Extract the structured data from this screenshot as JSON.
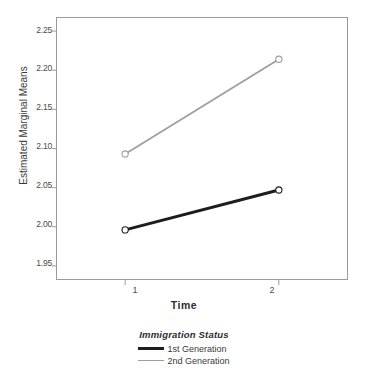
{
  "chart_data": {
    "type": "line",
    "title": "",
    "subtitle": "",
    "xlabel": "Time",
    "ylabel": "Estimated Marginal Means",
    "categories": [
      "1",
      "2"
    ],
    "x": [
      1,
      2
    ],
    "xlim": [
      0.55,
      2.45
    ],
    "ylim": [
      1.932,
      2.268
    ],
    "yticks": [
      "1.95",
      "2.00",
      "2.05",
      "2.10",
      "2.15",
      "2.20",
      "2.25"
    ],
    "ytick_values": [
      1.95,
      2.0,
      2.05,
      2.1,
      2.15,
      2.2,
      2.25
    ],
    "xticks": [
      "1",
      "2"
    ],
    "grid": false,
    "legend_position": "bottom",
    "legend_title": "Immigration Status",
    "markers": "open-circle",
    "series": [
      {
        "name": "1st Generation",
        "values": [
          1.996,
          2.047
        ],
        "color": "#1d1d1d",
        "linewidth": 3
      },
      {
        "name": "2nd Generation",
        "values": [
          2.093,
          2.214
        ],
        "color": "#9e9e9e",
        "linewidth": 1.7
      }
    ]
  },
  "axes": {
    "y_title": "Estimated Marginal Means",
    "x_title": "Time"
  },
  "legend": {
    "title": "Immigration Status",
    "entries": [
      {
        "label": "1st Generation"
      },
      {
        "label": "2nd Generation"
      }
    ]
  },
  "colors": {
    "series_1st_generation": "#1d1d1d",
    "series_2nd_generation": "#9e9e9e",
    "frame": "#9b9b9b",
    "background": "#ffffff",
    "text": "#3a3a3a"
  }
}
